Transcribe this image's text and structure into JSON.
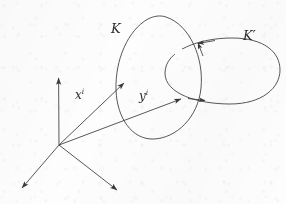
{
  "figure": {
    "kind": "link-diagram",
    "stroke_color": "#3a3a3a",
    "background_color": "#fdfdfd",
    "width": 286,
    "height": 204,
    "labels": {
      "curve_k": "K",
      "curve_k_prime": "K",
      "curve_k_prime_mark": "′",
      "vector_x": "x",
      "vector_x_index": "i",
      "vector_y": "y",
      "vector_y_index": "i"
    },
    "elements": {
      "origin_label": "origin",
      "axis_up": "vertical-axis",
      "axis_lower_left": "lower-left-axis",
      "axis_lower_right": "lower-right-axis",
      "loop_k": "left-loop-K",
      "loop_k_prime": "right-loop-K-prime"
    }
  }
}
